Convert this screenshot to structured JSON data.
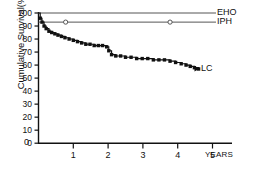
{
  "chart_data": {
    "type": "line",
    "title": "",
    "subtitle": "",
    "xlabel": "YEARS",
    "ylabel": "Cumulative Survival(%)",
    "xlim": [
      0,
      5.6
    ],
    "ylim": [
      0,
      100
    ],
    "grid": false,
    "legend_position": "right-inline-labels",
    "xticks": [
      0,
      1,
      2,
      3,
      4,
      5
    ],
    "xtick_labels": [
      "0",
      "1",
      "2",
      "3",
      "4",
      "5"
    ],
    "yticks": [
      0,
      10,
      20,
      30,
      40,
      50,
      60,
      70,
      80,
      90,
      100
    ],
    "ytick_labels": [
      "0",
      "10",
      "20",
      "30",
      "40",
      "50",
      "60",
      "70",
      "80",
      "90",
      "100"
    ],
    "annotations": [
      {
        "text": "EHO",
        "x": 5.05,
        "y": 100
      },
      {
        "text": "IPH",
        "x": 5.05,
        "y": 93
      },
      {
        "text": "LC",
        "x": 4.95,
        "y": 57
      }
    ],
    "series": [
      {
        "name": "EHO",
        "label": "EHO",
        "marker": "none",
        "style": "step",
        "color": "#555555",
        "x": [
          0.0,
          4.9
        ],
        "values": [
          100,
          100
        ]
      },
      {
        "name": "IPH",
        "label": "IPH",
        "marker": "open-circle",
        "style": "step",
        "color": "#555555",
        "x": [
          0.0,
          0.78,
          3.78,
          4.9
        ],
        "values": [
          93,
          93,
          93,
          93
        ],
        "marker_points": [
          {
            "x": 0.78,
            "y": 93
          },
          {
            "x": 3.78,
            "y": 93
          }
        ]
      },
      {
        "name": "LC",
        "label": "LC",
        "marker": "filled-square",
        "style": "step",
        "color": "#111111",
        "x": [
          0.0,
          0.05,
          0.1,
          0.16,
          0.22,
          0.3,
          0.38,
          0.47,
          0.56,
          0.66,
          0.76,
          0.88,
          1.0,
          1.12,
          1.24,
          1.36,
          1.48,
          1.6,
          1.72,
          1.84,
          1.96,
          2.02,
          2.1,
          2.22,
          2.36,
          2.5,
          2.66,
          2.82,
          2.98,
          3.14,
          3.3,
          3.46,
          3.62,
          3.78,
          3.94,
          4.1,
          4.24,
          4.36,
          4.48,
          4.6
        ],
        "values": [
          100,
          96,
          93,
          90,
          88,
          86,
          85,
          84,
          83,
          82,
          81,
          80,
          79,
          78,
          77,
          76,
          76,
          75,
          75,
          75,
          74,
          71,
          68,
          67,
          67,
          66,
          66,
          65,
          65,
          65,
          64,
          64,
          64,
          63,
          62,
          61,
          60,
          59,
          58,
          57
        ]
      }
    ]
  },
  "axes": {
    "x_unit_label": "YEARS"
  }
}
